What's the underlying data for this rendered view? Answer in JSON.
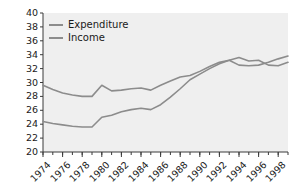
{
  "chart_data": {
    "type": "line",
    "title": "",
    "xlabel": "",
    "ylabel": "",
    "ylim": [
      20,
      40
    ],
    "xlim": [
      1974,
      1999
    ],
    "ytick_labels": [
      "40",
      "38",
      "36",
      "34",
      "32",
      "30",
      "28",
      "26",
      "24",
      "22",
      "20"
    ],
    "ytick_values": [
      40,
      38,
      36,
      34,
      32,
      30,
      28,
      26,
      24,
      22,
      20
    ],
    "xtick_labels": [
      "1974",
      "1976",
      "1978",
      "1980",
      "1982",
      "1984",
      "1986",
      "1988",
      "1990",
      "1992",
      "1994",
      "1996",
      "1998"
    ],
    "xtick_values": [
      1974,
      1976,
      1978,
      1980,
      1982,
      1984,
      1986,
      1988,
      1990,
      1992,
      1994,
      1996,
      1998
    ],
    "minor_xticks": [
      1974,
      1975,
      1976,
      1977,
      1978,
      1979,
      1980,
      1981,
      1982,
      1983,
      1984,
      1985,
      1986,
      1987,
      1988,
      1989,
      1990,
      1991,
      1992,
      1993,
      1994,
      1995,
      1996,
      1997,
      1998,
      1999
    ],
    "grid": false,
    "legend_position": "top-left",
    "plot_background": "#efefef",
    "line_color": "#8c8c8c",
    "x": [
      1974,
      1975,
      1976,
      1977,
      1978,
      1979,
      1980,
      1981,
      1982,
      1983,
      1984,
      1985,
      1986,
      1987,
      1988,
      1989,
      1990,
      1991,
      1992,
      1993,
      1994,
      1995,
      1996,
      1997,
      1998,
      1999
    ],
    "series": [
      {
        "name": "Expenditure",
        "values": [
          29.6,
          29.0,
          28.5,
          28.2,
          28.0,
          28.0,
          29.6,
          28.8,
          28.9,
          29.1,
          29.2,
          28.9,
          29.6,
          30.2,
          30.8,
          31.0,
          31.6,
          32.3,
          32.9,
          33.2,
          33.6,
          33.1,
          33.2,
          32.5,
          32.4,
          32.9
        ]
      },
      {
        "name": "Income",
        "values": [
          24.4,
          24.1,
          23.9,
          23.7,
          23.6,
          23.6,
          25.0,
          25.3,
          25.8,
          26.1,
          26.3,
          26.1,
          26.8,
          27.9,
          29.1,
          30.4,
          31.2,
          32.0,
          32.7,
          33.2,
          32.5,
          32.4,
          32.5,
          32.9,
          33.4,
          33.8
        ]
      }
    ],
    "legend": [
      {
        "label": "Expenditure"
      },
      {
        "label": "Income"
      }
    ]
  }
}
